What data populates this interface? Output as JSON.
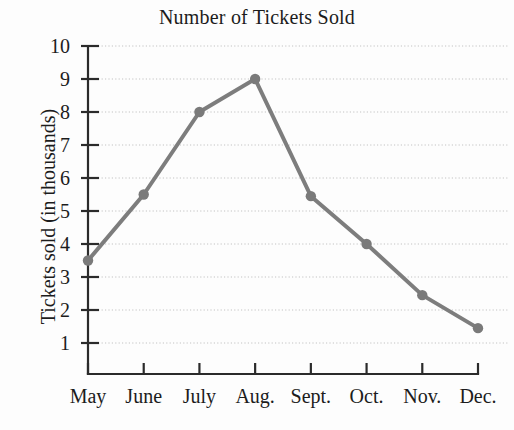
{
  "chart_data": {
    "type": "line",
    "title": "Number of Tickets Sold",
    "xlabel": "",
    "ylabel": "Tickets sold (in thousands)",
    "categories": [
      "May",
      "June",
      "July",
      "Aug.",
      "Sept.",
      "Oct.",
      "Nov.",
      "Dec."
    ],
    "values": [
      3.5,
      5.5,
      8,
      9,
      5.45,
      4,
      2.45,
      1.45
    ],
    "y_ticks": [
      1,
      2,
      3,
      4,
      5,
      6,
      7,
      8,
      9,
      10
    ],
    "y_tick_labels": [
      "1",
      "2",
      "3",
      "4",
      "5",
      "6",
      "7",
      "8",
      "9",
      "10"
    ],
    "ylim": [
      0,
      10
    ],
    "xlim_categories": 8,
    "grid": true,
    "grid_axis": "y",
    "grid_style": "dotted",
    "legend": false,
    "legend_position": "none",
    "series": [
      {
        "name": "Tickets sold",
        "values": [
          3.5,
          5.5,
          8,
          9,
          5.45,
          4,
          2.45,
          1.45
        ],
        "marker": "circle",
        "color": "#7d7d7d"
      }
    ]
  },
  "colors": {
    "line": "#7d7d7d",
    "marker": "#7a7a7a",
    "axis": "#2b2b2b",
    "grid": "#c3c3c3",
    "text": "#1c1c1c",
    "background": "#fdfdfd"
  },
  "axis": {
    "y_label_text": "Tickets sold (in thousands)",
    "y_tick_labels": [
      "10",
      "9",
      "8",
      "7",
      "6",
      "5",
      "4",
      "3",
      "2",
      "1"
    ],
    "x_tick_labels": [
      "May",
      "June",
      "July",
      "Aug.",
      "Sept.",
      "Oct.",
      "Nov.",
      "Dec."
    ]
  },
  "title": {
    "text": "Number of Tickets Sold"
  }
}
